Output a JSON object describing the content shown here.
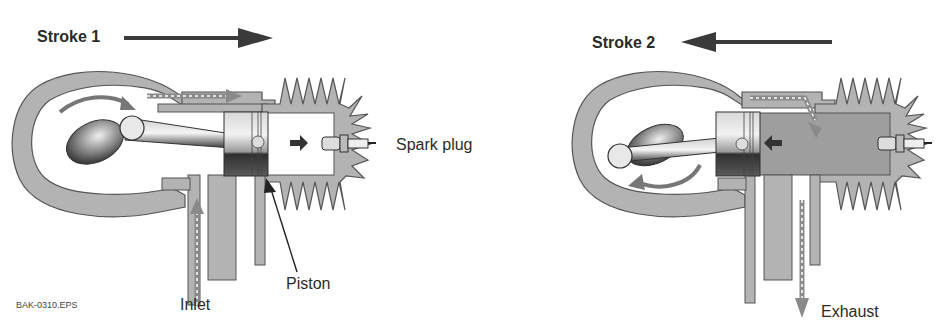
{
  "colors": {
    "casing": "#b3b3b3",
    "outline": "#555555",
    "arrow": "#444444",
    "flow_arrow": "#8a8a8a",
    "gas": "#9e9e9e",
    "piston_dark": "#4a4a4a",
    "text": "#2b2b2b"
  },
  "stroke1": {
    "title": "Stroke 1",
    "direction": "right",
    "labels": {
      "spark_plug": "Spark plug",
      "piston": "Piston",
      "inlet": "Inlet"
    }
  },
  "stroke2": {
    "title": "Stroke 2",
    "direction": "left",
    "labels": {
      "exhaust": "Exhaust"
    }
  },
  "file_label": "BAK-0310.EPS"
}
